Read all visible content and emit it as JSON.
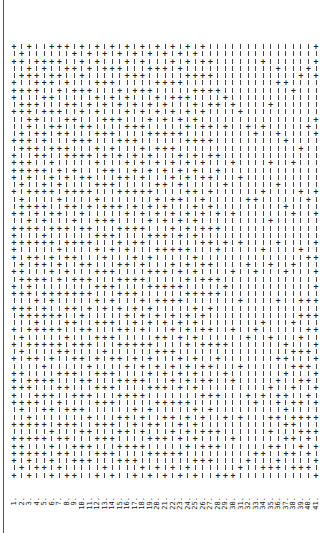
{
  "document": {
    "orientation": "rotated-90",
    "line_numbers": [
      "1.",
      "2.",
      "3.",
      "4.",
      "5.",
      "6.",
      "7.",
      "8.",
      "9.",
      "10.",
      "11.",
      "12.",
      "13.",
      "14.",
      "15.",
      "16.",
      "17.",
      "18.",
      "19.",
      "20.",
      "21.",
      "22.",
      "23.",
      "24.",
      "25.",
      "26.",
      "27.",
      "28.",
      "29.",
      "30.",
      "31.",
      "32.",
      "33.",
      "34.",
      "35.",
      "36.",
      "37.",
      "38.",
      "39.",
      "40.",
      "41."
    ],
    "lines": [
      "+-+--+++-+---+-++++-+--+-+++++-+-++-+--+-+-+-+++++--+-++++-+",
      "-++-+-+-++--+++-++-+-+++-+-+--+++-+-++--+-+--+-+-++-+-+++-+-+",
      "+--++-+-++++-++-+++-+-+-++-+-+--+++-++-+-+-+--++-+-++-+-++-++",
      "--+-+++-+-+-+-++-+--+-++-+-+-++-+--+-+++-+-+--+-++--+-+-+-+-+",
      "--++-+-+-+--++-+-+-++-+-+-++--+-+-+-++-+-+--+-+-+-+-+-+-+-+-+",
      "+-+-++-+-+-+--+-+-+-+--+-+-+-+-+--++-+-+-+-+--+-+-+--+-+-+-++",
      "+-+-+-+--+-++-+--+-+-+-+-+--+-+-+-+--+-+-++--+-+-+--+-+-+-+-+",
      "+--+-+--+-+-+-++--+-+-+--+-+-+-+--+-+-+-+-+--+-+--+-+-+-+--++",
      "-+-+--+-+-+--+-+-+--+-+-+--+-+--+-+-+-+--+-+-+--+-+-+--+-+-++",
      "+-+-+-+--+-+-+-+--+-+--+-+-+--+-+-+--+-+-+-+--+-+-+--+-+-+--+",
      "-+-+--+-+--+-+-+--+-+-+--+-+--+-+-+-+--+-+--+-+-+--+-+-+-+--+",
      "+-+--+-+-+--+-+-+--+-+--+-+-+--+-+-+--+-+--+-+-+-+--+-+-+--++",
      "-+-+-+--+-+-+--+-+-+--+-+-+--+-+-+--+-+-+-+--+-+-+--+-+-+-+-+",
      "+--+-+-+--+-+-+--+-+--+-+-+-+--+-+-+--+-+--+-+-+-+--+-+-+--++",
      "-+-+--+-+-+--+-+--+-+-+--+-+--+-+-+-+--+-+-+--+-+--+-+-+-+--+",
      "+-+-+--+-+-+-+--+-+-+--+-+--+-+-+-+--+-+-+--+-+-+--+-+-+-+--+",
      "-+--+-+-+--+-+-+-+--+-+--+-+-+--+-+-+-+--+-+--+-+-+-+--+-+-++",
      "+-+-+-+--+-+--+-+-+-+--+-+-+--+-+--+-+-+-+--+-+-+--+-+-+--+-+",
      "-+-+--+-+-+-+--+-+--+-+-+-+--+-+-+--+-+--+-+-+-+--+-+-+-+--++",
      "+--+-+-+-+--+-+-+--+-+-+--+-+--+-+-+-+--+-+-+--+-+--+-+-+-+-+",
      "-+-+-+--+-+-+-+--+-+--+-+-+-+--+-+-+--+-+-+--+-+-+-+--+-+--++",
      "+-+--+-+-+--+-+-+-+--+-+-+--+-+--+-+-+-+--+-+-+--+-+-+--+-+-+",
      "-+-+-+-+--+-+--+-+-+-+--+-+-+--+-+-+--+-+--+-+-+-+--+-+-+--++",
      "+-+-+--+-+-+-+--+-+-+--+-+--+-+-+-+--+-+-+--+-+--+-+-+-+--+-+",
      "-+--+-+-+-+--+-+-+--+-+-+-+--+-+--+-+-+-+--+-+-+--+-+-+--+-++",
      "+-+-+-+--+-+-+--+-+--+-+-+-+--+-+-+--+-+-+--+-+-+--+-+-+-+--+",
      "--+-+-+-+--+-+-+--+-+-+--+-+--+-+-+-+--+-+--+-+-+-+--+-+-+--+",
      "------+-+------+-+-----+-+--+---+-+------+-+----+----+-+---++",
      "-------+---+-------+-------+-----+-------+---+-----+-------+-+",
      "--------+-------+------+-------+-------+------+-------+----+-+",
      "---------+--------+--------+-------+--------+------+------+-+",
      "-----------+---------+--------+---------+-------+--------+--+",
      "------------+--------+---------+-------+---------+------+---+",
      "--+--------+--------+-------+---------+---------+-------+-+-+",
      "--------+-------+-------+-----+---------+------+---+-+-+--+-+",
      "---+-+------+------+-------+-------+-------+--+-++-+---+-++-+",
      "-----+-------+--------+--------+---------+-+-+--+-+-+-+-+---+",
      "------+---------+------+------+-------+---+-+--+-+-++-+-+-+-+",
      "----+---------+-----+-------+------+-+--+-+-+-+--+-+-+-+--+-+",
      "---+-------+---------+-------+-----+-+-+--+-+-+-+--+-++-+-+-+",
      "+-+-+-----+-+-------+--+---+-+-+-+-+-+-+-+-+-+-+-+-+-+-+-+-++"
    ]
  }
}
